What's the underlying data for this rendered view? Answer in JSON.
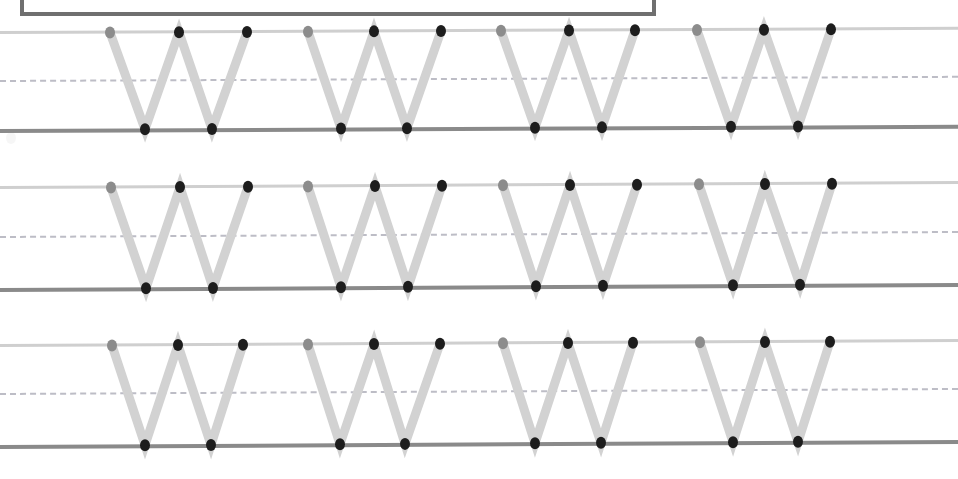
{
  "worksheet": {
    "title": "Letter W tracing practice worksheet",
    "page_width": 958,
    "page_height": 479,
    "background_color": "#ffffff",
    "letter": "W",
    "letter_case": "uppercase",
    "row_count": 3,
    "letters_per_row": 4,
    "title_box": {
      "label": "title-box",
      "x": 20,
      "y": -40,
      "width": 636,
      "height": 56,
      "border_color": "#6f6f6f",
      "border_width": 4
    },
    "guide_lines": {
      "top_line_color": "#cfcfcf",
      "mid_line_color": "#bdbdc6",
      "mid_line_style": "dashed",
      "base_line_color": "#8a8a8a",
      "top_line_height": 3,
      "base_line_height": 4
    },
    "stroke": {
      "color": "#d2d2d2",
      "width": 9,
      "linecap": "round"
    },
    "dots": {
      "start_color": "#8c8c8c",
      "point_color": "#1d1d1d",
      "radius_x": 5,
      "radius_y": 6
    },
    "rows": [
      {
        "name": "row-1",
        "top_y": 31,
        "mid_y": 80,
        "base_y": 129,
        "skew_deg": -0.25,
        "letters": [
          {
            "name": "letter-w-1",
            "top_xs": [
              110,
              179,
              247
            ],
            "bottom_xs": [
              145,
              212
            ]
          },
          {
            "name": "letter-w-2",
            "top_xs": [
              308,
              374,
              441
            ],
            "bottom_xs": [
              341,
              407
            ]
          },
          {
            "name": "letter-w-3",
            "top_xs": [
              501,
              569,
              635
            ],
            "bottom_xs": [
              535,
              602
            ]
          },
          {
            "name": "letter-w-4",
            "top_xs": [
              697,
              764,
              831
            ],
            "bottom_xs": [
              731,
              798
            ]
          }
        ]
      },
      {
        "name": "row-2",
        "top_y": 186,
        "mid_y": 236,
        "base_y": 288,
        "skew_deg": -0.3,
        "letters": [
          {
            "name": "letter-w-1",
            "top_xs": [
              111,
              180,
              248
            ],
            "bottom_xs": [
              146,
              213
            ]
          },
          {
            "name": "letter-w-2",
            "top_xs": [
              308,
              375,
              442
            ],
            "bottom_xs": [
              341,
              408
            ]
          },
          {
            "name": "letter-w-3",
            "top_xs": [
              503,
              570,
              637
            ],
            "bottom_xs": [
              536,
              603
            ]
          },
          {
            "name": "letter-w-4",
            "top_xs": [
              699,
              765,
              832
            ],
            "bottom_xs": [
              733,
              800
            ]
          }
        ]
      },
      {
        "name": "row-3",
        "top_y": 344,
        "mid_y": 393,
        "base_y": 445,
        "skew_deg": -0.3,
        "letters": [
          {
            "name": "letter-w-1",
            "top_xs": [
              112,
              178,
              243
            ],
            "bottom_xs": [
              145,
              211
            ]
          },
          {
            "name": "letter-w-2",
            "top_xs": [
              308,
              374,
              440
            ],
            "bottom_xs": [
              340,
              405
            ]
          },
          {
            "name": "letter-w-3",
            "top_xs": [
              503,
              568,
              633
            ],
            "bottom_xs": [
              535,
              601
            ]
          },
          {
            "name": "letter-w-4",
            "top_xs": [
              700,
              765,
              830
            ],
            "bottom_xs": [
              733,
              798
            ]
          }
        ]
      }
    ]
  }
}
